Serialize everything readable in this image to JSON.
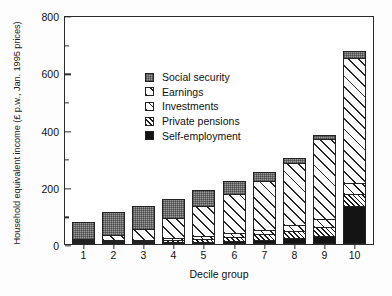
{
  "chart_data": {
    "type": "bar",
    "subtype": "stacked-bar",
    "title": "",
    "xlabel": "Decile group",
    "ylabel": "Household equivalent income (£ p.w., Jan. 1995 prices)",
    "categories": [
      "1",
      "2",
      "3",
      "4",
      "5",
      "6",
      "7",
      "8",
      "9",
      "10"
    ],
    "ylim": [
      0,
      800
    ],
    "yticks": [
      0,
      200,
      400,
      600,
      800
    ],
    "ytick_labels": [
      "0",
      "200",
      "400",
      "600",
      "800"
    ],
    "yminor_ticks": [
      100,
      300,
      500,
      700
    ],
    "grid": false,
    "legend_position": "upper-left-inside",
    "stack_order_bottom_to_top": [
      "Self-employment",
      "Private pensions",
      "Investments",
      "Earnings",
      "Social security"
    ],
    "series": [
      {
        "name": "Self-employment",
        "pattern": "solid-black",
        "color": "#141414",
        "values": [
          2,
          3,
          4,
          5,
          7,
          10,
          13,
          20,
          28,
          132
        ]
      },
      {
        "name": "Private pensions",
        "pattern": "dense-diagonal-hatch",
        "color": "#ffffff",
        "values": [
          3,
          4,
          6,
          9,
          13,
          18,
          24,
          30,
          36,
          46
        ]
      },
      {
        "name": "Investments",
        "pattern": "medium-diagonal-hatch",
        "color": "#ffffff",
        "values": [
          4,
          6,
          8,
          11,
          14,
          17,
          20,
          24,
          30,
          42
        ]
      },
      {
        "name": "Earnings",
        "pattern": "wide-diagonal-hatch",
        "color": "#fbfbfb",
        "values": [
          6,
          20,
          42,
          73,
          109,
          142,
          173,
          219,
          283,
          440
        ]
      },
      {
        "name": "Social security",
        "pattern": "checkered-gray",
        "color": "#9a9a9a",
        "values": [
          62,
          86,
          83,
          73,
          60,
          46,
          35,
          20,
          18,
          28
        ]
      }
    ],
    "totals": [
      77,
      119,
      143,
      171,
      203,
      233,
      265,
      313,
      395,
      688
    ]
  },
  "legend": {
    "items": [
      {
        "label": "Social security"
      },
      {
        "label": "Earnings"
      },
      {
        "label": "Investments"
      },
      {
        "label": "Private pensions"
      },
      {
        "label": "Self-employment"
      }
    ]
  }
}
